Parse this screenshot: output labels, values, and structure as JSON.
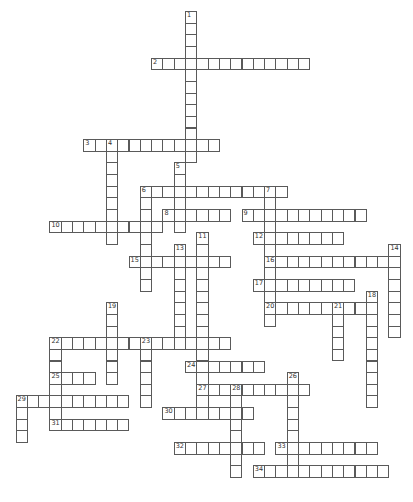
{
  "puzzle": {
    "type": "crossword",
    "grid": {
      "x0": 15.5,
      "y0": 11,
      "cell_w": 11.3,
      "cell_h": 11.65
    },
    "border_color": "#5a5a5a",
    "entries": [
      {
        "number": "1",
        "dir": "down",
        "col": 15,
        "row": 0,
        "length": 13
      },
      {
        "number": "2",
        "dir": "across",
        "col": 12,
        "row": 4,
        "length": 14
      },
      {
        "number": "3",
        "dir": "across",
        "col": 6,
        "row": 11,
        "length": 12
      },
      {
        "number": "4",
        "dir": "down",
        "col": 8,
        "row": 11,
        "length": 9
      },
      {
        "number": "5",
        "dir": "down",
        "col": 14,
        "row": 13,
        "length": 6
      },
      {
        "number": "6",
        "dir": "across",
        "col": 11,
        "row": 15,
        "length": 13
      },
      {
        "number": "6",
        "dir": "down",
        "col": 11,
        "row": 15,
        "length": 9
      },
      {
        "number": "7",
        "dir": "down",
        "col": 22,
        "row": 15,
        "length": 12
      },
      {
        "number": "8",
        "dir": "across",
        "col": 13,
        "row": 17,
        "length": 6
      },
      {
        "number": "9",
        "dir": "across",
        "col": 20,
        "row": 17,
        "length": 11
      },
      {
        "number": "10",
        "dir": "across",
        "col": 3,
        "row": 18,
        "length": 10
      },
      {
        "number": "11",
        "dir": "down",
        "col": 16,
        "row": 19,
        "length": 16
      },
      {
        "number": "12",
        "dir": "across",
        "col": 21,
        "row": 19,
        "length": 8
      },
      {
        "number": "13",
        "dir": "down",
        "col": 14,
        "row": 20,
        "length": 9
      },
      {
        "number": "14",
        "dir": "down",
        "col": 33,
        "row": 20,
        "length": 8
      },
      {
        "number": "15",
        "dir": "across",
        "col": 10,
        "row": 21,
        "length": 9
      },
      {
        "number": "16",
        "dir": "across",
        "col": 22,
        "row": 21,
        "length": 12
      },
      {
        "number": "17",
        "dir": "across",
        "col": 21,
        "row": 23,
        "length": 9
      },
      {
        "number": "18",
        "dir": "down",
        "col": 31,
        "row": 24,
        "length": 10
      },
      {
        "number": "19",
        "dir": "down",
        "col": 8,
        "row": 25,
        "length": 7
      },
      {
        "number": "20",
        "dir": "across",
        "col": 22,
        "row": 25,
        "length": 10
      },
      {
        "number": "21",
        "dir": "down",
        "col": 28,
        "row": 25,
        "length": 5
      },
      {
        "number": "22",
        "dir": "across",
        "col": 3,
        "row": 28,
        "length": 16
      },
      {
        "number": "22",
        "dir": "down",
        "col": 3,
        "row": 28,
        "length": 8
      },
      {
        "number": "23",
        "dir": "down",
        "col": 11,
        "row": 28,
        "length": 6
      },
      {
        "number": "24",
        "dir": "across",
        "col": 15,
        "row": 30,
        "length": 7
      },
      {
        "number": "25",
        "dir": "across",
        "col": 3,
        "row": 31,
        "length": 4
      },
      {
        "number": "26",
        "dir": "down",
        "col": 24,
        "row": 31,
        "length": 9
      },
      {
        "number": "27",
        "dir": "across",
        "col": 16,
        "row": 32,
        "length": 10
      },
      {
        "number": "28",
        "dir": "down",
        "col": 19,
        "row": 32,
        "length": 8
      },
      {
        "number": "29",
        "dir": "across",
        "col": 0,
        "row": 33,
        "length": 10
      },
      {
        "number": "29",
        "dir": "down",
        "col": 0,
        "row": 33,
        "length": 4
      },
      {
        "number": "30",
        "dir": "across",
        "col": 13,
        "row": 34,
        "length": 8
      },
      {
        "number": "31",
        "dir": "across",
        "col": 3,
        "row": 35,
        "length": 7
      },
      {
        "number": "32",
        "dir": "across",
        "col": 14,
        "row": 37,
        "length": 8
      },
      {
        "number": "33",
        "dir": "across",
        "col": 23,
        "row": 37,
        "length": 9
      },
      {
        "number": "34",
        "dir": "across",
        "col": 21,
        "row": 39,
        "length": 12
      }
    ]
  }
}
